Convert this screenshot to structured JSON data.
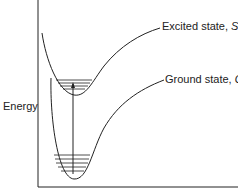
{
  "diagram": {
    "y_axis_label": "Energy",
    "curves": [
      {
        "name": "Excited state",
        "symbol": "S",
        "subscript": "1",
        "vibrational_levels": 4
      },
      {
        "name": "Ground state",
        "symbol": "G",
        "subscript": "",
        "vibrational_levels": 5
      }
    ],
    "transition": "vertical arrow from ground state lowest level to excited state",
    "excited_label_prefix": "Excited state, ",
    "excited_symbol": "S",
    "excited_sub": "1",
    "ground_label_prefix": "Ground state, ",
    "ground_symbol": "G"
  }
}
